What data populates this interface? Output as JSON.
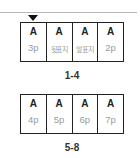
{
  "spreads": [
    {
      "label": "1-4",
      "selected_index": 0,
      "pages": [
        {
          "glyph": "A",
          "page": "3p"
        },
        {
          "glyph": "A",
          "page": "뒷표지"
        },
        {
          "glyph": "A",
          "page": "앞표지"
        },
        {
          "glyph": "A",
          "page": "2p"
        }
      ]
    },
    {
      "label": "5-8",
      "pages": [
        {
          "glyph": "A",
          "page": "4p"
        },
        {
          "glyph": "A",
          "page": "5p"
        },
        {
          "glyph": "A",
          "page": "6p"
        },
        {
          "glyph": "A",
          "page": "7p"
        }
      ]
    }
  ],
  "icons": {
    "marker": "triangle-down-icon"
  },
  "colors": {
    "border": "#222222",
    "page_text": "#9a9a9a",
    "divider": "#b8b8b8"
  }
}
